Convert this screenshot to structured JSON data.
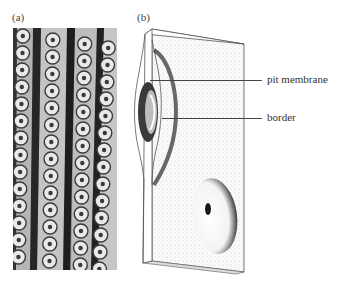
{
  "figure": {
    "panels": [
      {
        "id": "a",
        "label": "(a)",
        "description": "Light micrograph of tracheids with rows of circular bordered pits"
      },
      {
        "id": "b",
        "label": "(b)",
        "description": "Drawing of a bordered pit pair in a cut block of cell wall"
      }
    ],
    "callouts": [
      {
        "text": "pit membrane"
      },
      {
        "text": "border"
      }
    ]
  },
  "colors": {
    "background": "#ffffff",
    "dark_wall": "#2a2a2a",
    "pit_light": "#e8e8e8",
    "stipple": "#9a9a9a"
  }
}
